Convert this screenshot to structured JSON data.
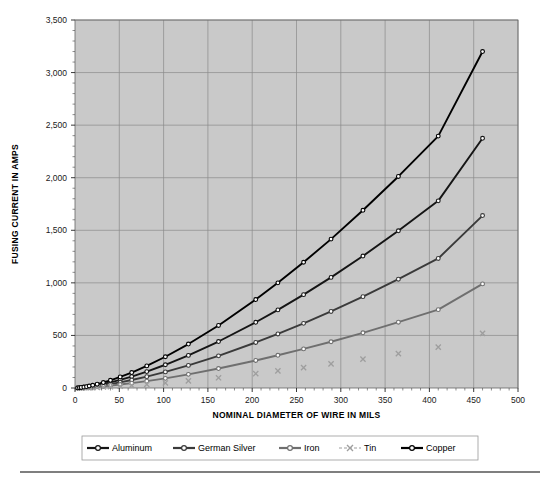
{
  "chart_data": {
    "type": "line",
    "title": "",
    "xlabel": "NOMINAL DIAMETER OF WIRE IN MILS",
    "ylabel": "FUSING CURRENT IN AMPS",
    "xlim": [
      0,
      500
    ],
    "ylim": [
      0,
      3500
    ],
    "xticks": [
      0,
      50,
      100,
      150,
      200,
      250,
      300,
      350,
      400,
      450,
      500
    ],
    "xtick_labels": [
      "0",
      "50",
      "100",
      "150",
      "200",
      "250",
      "300",
      "350",
      "400",
      "450",
      "500"
    ],
    "yticks": [
      0,
      500,
      1000,
      1500,
      2000,
      2500,
      3000,
      3500
    ],
    "ytick_labels": [
      "0",
      "500",
      "1,000",
      "1,500",
      "2,000",
      "2,500",
      "3,000",
      "3,500"
    ],
    "grid": true,
    "minor_ticks": true,
    "legend_position": "bottom",
    "plot_background": "#c9c9c9",
    "grid_color": "#8a8a8a",
    "x": [
      3,
      5,
      7,
      10,
      13,
      16,
      20,
      25,
      32,
      40,
      51,
      64,
      81,
      102,
      128,
      162,
      204,
      229,
      258,
      289,
      325,
      365,
      410,
      460
    ],
    "series": [
      {
        "name": "Aluminum",
        "color": "#151515",
        "marker": "circle",
        "values": [
          1,
          2,
          4,
          7,
          10,
          14,
          19,
          27,
          39,
          54,
          78,
          109,
          156,
          221,
          310,
          442,
          625,
          743,
          888,
          1052,
          1255,
          1495,
          1780,
          2375
        ]
      },
      {
        "name": "German Silver",
        "color": "#3a3a3a",
        "marker": "circle",
        "values": [
          1,
          1,
          3,
          5,
          7,
          10,
          14,
          19,
          27,
          38,
          54,
          76,
          108,
          153,
          215,
          306,
          433,
          514,
          615,
          728,
          869,
          1035,
          1232,
          1640
        ]
      },
      {
        "name": "Iron",
        "color": "#6f6f6f",
        "marker": "circle",
        "values": [
          0,
          1,
          2,
          3,
          4,
          6,
          8,
          11,
          16,
          23,
          33,
          46,
          65,
          92,
          130,
          185,
          262,
          311,
          372,
          440,
          525,
          626,
          745,
          990
        ]
      },
      {
        "name": "Tin",
        "color": "#9e9e9e",
        "marker": "cross",
        "values": [
          0,
          0,
          1,
          2,
          2,
          3,
          4,
          6,
          9,
          12,
          17,
          24,
          34,
          48,
          68,
          97,
          137,
          163,
          194,
          230,
          275,
          327,
          389,
          520
        ]
      },
      {
        "name": "Copper",
        "color": "#000000",
        "marker": "circle",
        "values": [
          1,
          3,
          5,
          9,
          13,
          19,
          26,
          36,
          52,
          73,
          105,
          147,
          210,
          297,
          418,
          595,
          841,
          1000,
          1196,
          1416,
          1690,
          2012,
          2396,
          3200
        ]
      }
    ]
  },
  "legend": {
    "items": [
      {
        "label": "Aluminum"
      },
      {
        "label": "German Silver"
      },
      {
        "label": "Iron"
      },
      {
        "label": "Tin"
      },
      {
        "label": "Copper"
      }
    ]
  }
}
